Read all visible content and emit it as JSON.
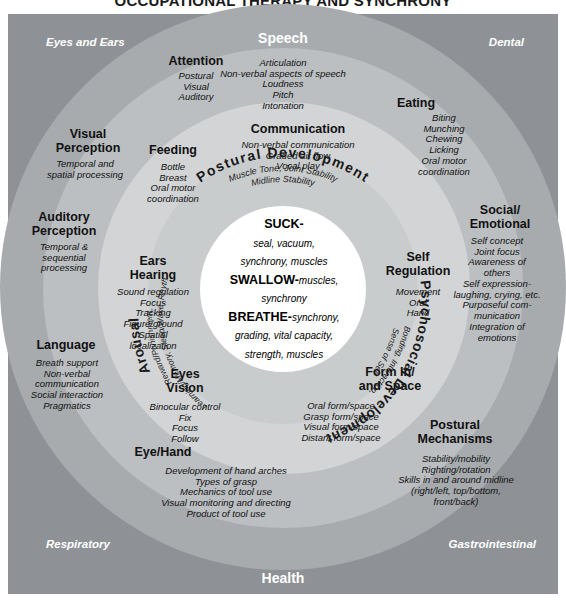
{
  "title": "OCCUPATIONAL THERAPY AND SYNCHRONY",
  "corners": {
    "top_left": "Eyes and Ears",
    "top_right": "Dental",
    "bottom_left": "Respiratory",
    "bottom_right": "Gastrointestinal"
  },
  "edge_labels": {
    "top": "Speech",
    "bottom": "Health"
  },
  "colors": {
    "background": "#ffffff",
    "ring_outer": "#a7abae",
    "ring_mid": "#bcbfc1",
    "ring_inner_outer": "#d2d4d5",
    "ring_inner": "#c9cccd",
    "core": "#ffffff",
    "text": "#111111",
    "corner_text": "#ffffff"
  },
  "core": {
    "line1_head": "SUCK-",
    "line1_body": "seal, vacuum,",
    "line2_body": "synchrony, muscles",
    "line3_head": "SWALLOW-",
    "line3_body": "muscles,",
    "line4_body": "synchrony",
    "line5_head": "BREATHE-",
    "line5_body": "synchrony,",
    "line6_body": "grading, vital capacity,",
    "line7_body": "strength, muscles"
  },
  "inner_ring": [
    {
      "name": "postural-development",
      "title": "Postural Development",
      "items": [
        "Muscle Tone, Joint Stability",
        "Midline Stability"
      ]
    },
    {
      "name": "psychosocial-development",
      "title": "Psychosocial Development",
      "items": [
        "Bonding, Interaction,",
        "Sense of Self"
      ]
    },
    {
      "name": "arousal",
      "title": "Arousal",
      "items": [
        "Reward/Punishment,",
        "Learning/Memory,",
        "Sleep/Wake, Rhythm"
      ]
    }
  ],
  "middle_ring": [
    {
      "name": "attention",
      "title": "Attention",
      "items": [
        "Postural",
        "Visual",
        "Auditory"
      ]
    },
    {
      "name": "communication",
      "title": "Communication",
      "items": [
        "Non-verbal communication",
        "Graded air flow",
        "Vocal play"
      ]
    },
    {
      "name": "feeding",
      "title": "Feeding",
      "items": [
        "Bottle",
        "Breast",
        "Oral motor",
        "coordination"
      ]
    },
    {
      "name": "ears-hearing",
      "title": "Ears\nHearing",
      "title_l1": "Ears",
      "title_l2": "Hearing",
      "items": [
        "Sound regulation",
        "Focus",
        "Tracking",
        "Figure/ground",
        "Spatial",
        "localization"
      ]
    },
    {
      "name": "eyes-vision",
      "title_l1": "Eyes",
      "title_l2": "Vision",
      "items": [
        "Binocular control",
        "Fix",
        "Focus",
        "Follow"
      ]
    },
    {
      "name": "form-in-and-space",
      "title_l1": "Form In/",
      "title_l2": "and Space",
      "items": [
        "Oral form/space",
        "Grasp form/space",
        "Visual form/space",
        "Distant form/space"
      ]
    },
    {
      "name": "self-regulation",
      "title_l1": "Self",
      "title_l2": "Regulation",
      "items": [
        "Movement",
        "Oral",
        "Hand"
      ]
    }
  ],
  "outer_ring": [
    {
      "name": "speech",
      "title": "Speech",
      "items": [
        "Articulation",
        "Non-verbal aspects of speech",
        "Loudness",
        "Pitch",
        "Intonation"
      ]
    },
    {
      "name": "eating",
      "title": "Eating",
      "items": [
        "Biting",
        "Munching",
        "Chewing",
        "Licking",
        "Oral motor",
        "coordination"
      ]
    },
    {
      "name": "social-emotional",
      "title_l1": "Social/",
      "title_l2": "Emotional",
      "items": [
        "Self concept",
        "Joint focus",
        "Awareness of",
        "others",
        "Self expression-",
        "laughing, crying, etc.",
        "Purposeful com-",
        "munication",
        "Integration of",
        "emotions"
      ]
    },
    {
      "name": "postural-mechanisms",
      "title_l1": "Postural",
      "title_l2": "Mechanisms",
      "items": [
        "Stability/mobility",
        "Righting/rotation",
        "Skills in and around midline",
        "(right/left, top/bottom,",
        "front/back)"
      ]
    },
    {
      "name": "eye-hand",
      "title": "Eye/Hand",
      "items": [
        "Development of hand arches",
        "Types of grasp",
        "Mechanics of tool use",
        "Visual monitoring and directing",
        "Product of tool use"
      ]
    },
    {
      "name": "language",
      "title": "Language",
      "items": [
        "Breath support",
        "Non-verbal",
        "communication",
        "Social interaction",
        "Pragmatics"
      ]
    },
    {
      "name": "auditory-perception",
      "title_l1": "Auditory",
      "title_l2": "Perception",
      "items": [
        "Temporal &",
        "sequential",
        "processing"
      ]
    },
    {
      "name": "visual-perception",
      "title_l1": "Visual",
      "title_l2": "Perception",
      "items": [
        "Temporal and",
        "spatial processing"
      ]
    }
  ]
}
